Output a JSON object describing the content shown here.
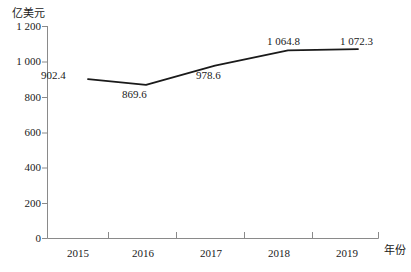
{
  "chart_data": {
    "type": "line",
    "title": "",
    "subtitle": "",
    "xlabel": "年份",
    "ylabel": "亿美元",
    "categories": [
      "2015",
      "2016",
      "2017",
      "2018",
      "2019"
    ],
    "values": [
      902.4,
      869.6,
      978.6,
      1064.8,
      1072.3
    ],
    "data_labels": [
      "902.4",
      "869.6",
      "978.6",
      "1 064.8",
      "1 072.3"
    ],
    "series": [
      {
        "name": "",
        "values": [
          902.4,
          869.6,
          978.6,
          1064.8,
          1072.3
        ]
      }
    ],
    "ylim": [
      0,
      1200
    ],
    "y_ticks": [
      0,
      200,
      400,
      600,
      800,
      1000,
      1200
    ],
    "y_tick_labels": [
      "0",
      "200",
      "400",
      "600",
      "800",
      "1 000",
      "1 200"
    ],
    "x_tick_labels": [
      "2015",
      "2016",
      "2017",
      "2018",
      "2019"
    ],
    "grid": false,
    "legend": false,
    "legend_position": "none",
    "line_color": "#1a1a1a",
    "axis_color": "#808080",
    "marker": "none"
  },
  "axes": {
    "y_unit_label": "亿美元",
    "x_axis_title": "年份"
  },
  "labels": {
    "y": {
      "t1200": "1 200",
      "t1000": "1 000",
      "t800": "800",
      "t600": "600",
      "t400": "400",
      "t200": "200",
      "t0": "0"
    },
    "x": {
      "y2015": "2015",
      "y2016": "2016",
      "y2017": "2017",
      "y2018": "2018",
      "y2019": "2019"
    },
    "points": {
      "p2015": "902.4",
      "p2016": "869.6",
      "p2017": "978.6",
      "p2018": "1 064.8",
      "p2019": "1 072.3"
    }
  }
}
